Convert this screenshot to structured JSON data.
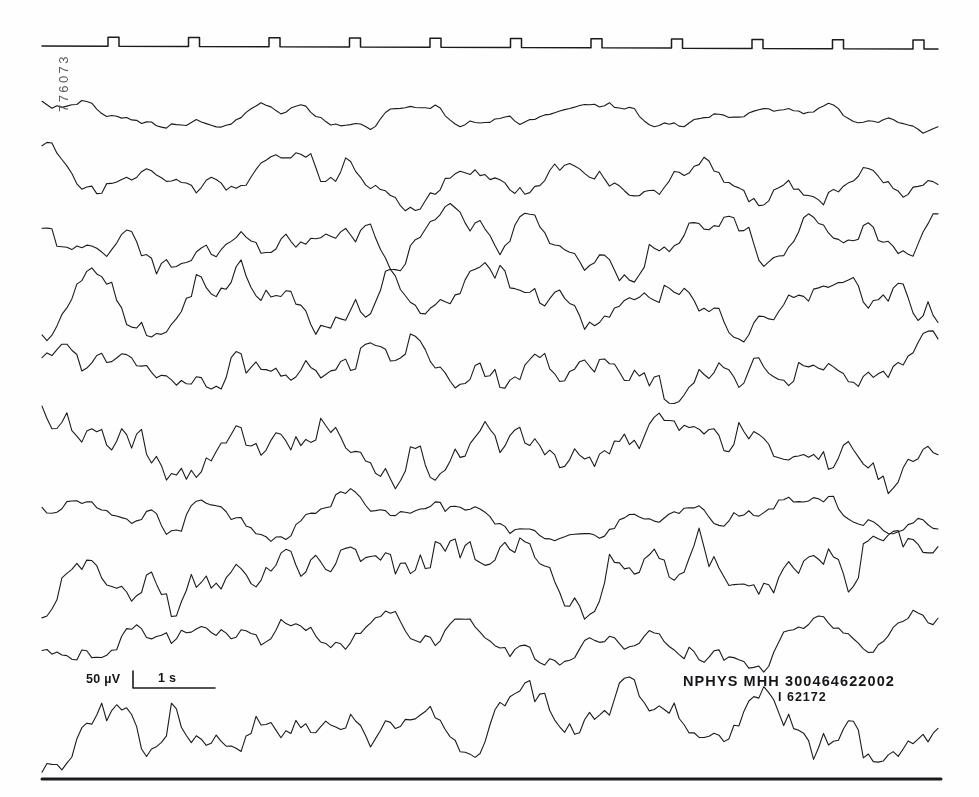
{
  "page": {
    "width": 979,
    "height": 797,
    "background_color": "#fefefe",
    "ink_color": "#1b1b1f"
  },
  "annotations": {
    "recording_id_vertical": "776073",
    "record_label_line1": "NPHYS MHH 300464622002",
    "record_label_line2": "I 62172"
  },
  "scale_bar": {
    "amplitude_label": "50 µV",
    "time_label": "1 s",
    "amplitude_value": 50,
    "amplitude_unit": "µV",
    "time_value": 1,
    "time_unit": "s",
    "origin_x": 133,
    "origin_y": 688,
    "vertical_height_px": 17,
    "horizontal_length_px": 82
  },
  "footer_rule": {
    "x1": 42,
    "x2": 941,
    "y": 779,
    "thickness": 3
  },
  "chart_data": {
    "type": "line",
    "subtitle": "Multi-channel electroencephalogram trace",
    "xlabel": "Time",
    "ylabel": "Channel",
    "grid": false,
    "legend_position": "none",
    "x_range_px": [
      42,
      938
    ],
    "trace_color": "#1b1b1f",
    "trace_width": 1.1,
    "sample_count": 180,
    "marker_channel": {
      "name": "time-marker",
      "label": "Timing marker pulses",
      "baseline_y": 46,
      "x_start": 42,
      "x_end": 938,
      "pulse_count": 11,
      "pulse_spacing_px": 80.5,
      "first_pulse_x": 108,
      "pulse_width_px": 11,
      "pulse_height_px": 9,
      "baseline_tilt_px": 3
    },
    "channels": [
      {
        "index": 1,
        "name": "channel-1",
        "baseline_y": 113,
        "amplitude": 13,
        "roughness": 0.34,
        "seed": 1207,
        "base_freq": 1.55,
        "drift": 4
      },
      {
        "index": 2,
        "name": "channel-2",
        "baseline_y": 176,
        "amplitude": 21,
        "roughness": 0.52,
        "seed": 4391,
        "base_freq": 1.85,
        "drift": 3
      },
      {
        "index": 3,
        "name": "channel-3",
        "baseline_y": 246,
        "amplitude": 24,
        "roughness": 0.55,
        "seed": 8823,
        "base_freq": 2.05,
        "drift": -2
      },
      {
        "index": 4,
        "name": "channel-4",
        "baseline_y": 307,
        "amplitude": 27,
        "roughness": 0.62,
        "seed": 2574,
        "base_freq": 2.25,
        "drift": 2
      },
      {
        "index": 5,
        "name": "channel-5",
        "baseline_y": 372,
        "amplitude": 24,
        "roughness": 0.58,
        "seed": 6611,
        "base_freq": 2.1,
        "drift": -3
      },
      {
        "index": 6,
        "name": "channel-6",
        "baseline_y": 443,
        "amplitude": 28,
        "roughness": 0.66,
        "seed": 9045,
        "base_freq": 2.4,
        "drift": 1
      },
      {
        "index": 7,
        "name": "channel-7",
        "baseline_y": 513,
        "amplitude": 18,
        "roughness": 0.44,
        "seed": 3158,
        "base_freq": 1.7,
        "drift": 3
      },
      {
        "index": 8,
        "name": "channel-8",
        "baseline_y": 578,
        "amplitude": 27,
        "roughness": 0.64,
        "seed": 7392,
        "base_freq": 2.3,
        "drift": -2
      },
      {
        "index": 9,
        "name": "channel-9",
        "baseline_y": 637,
        "amplitude": 19,
        "roughness": 0.47,
        "seed": 5126,
        "base_freq": 1.95,
        "drift": 2
      },
      {
        "index": 10,
        "name": "channel-10",
        "baseline_y": 722,
        "amplitude": 26,
        "roughness": 0.7,
        "seed": 1984,
        "base_freq": 2.55,
        "drift": 1
      }
    ]
  }
}
